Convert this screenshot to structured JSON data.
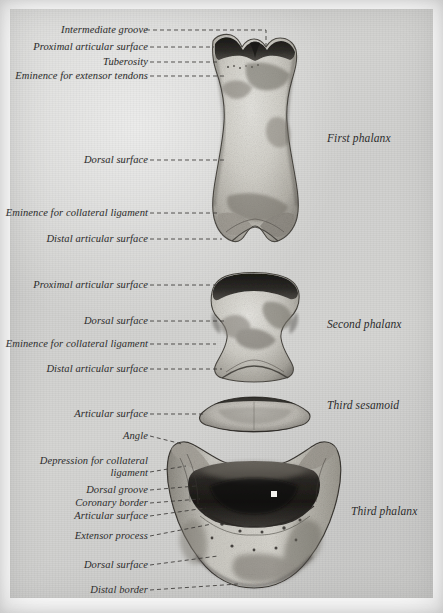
{
  "plate": {
    "subject": "Bones of the equine digit, dorsal aspect",
    "background_color": "#d3d3d1",
    "paper_color": "#d3d3d1",
    "ink_color": "#2b2b2b",
    "bone_light": "#d9d8d3",
    "bone_mid": "#9a9790",
    "bone_dark": "#2e2c29"
  },
  "left_labels": [
    {
      "id": "intermediate-groove",
      "text": "Intermediate groove"
    },
    {
      "id": "proximal-articular-surface-1",
      "text": "Proximal articular surface"
    },
    {
      "id": "tuberosity",
      "text": "Tuberosity"
    },
    {
      "id": "eminence-for-extensor-tendons",
      "text": "Eminence for extensor tendons"
    },
    {
      "id": "dorsal-surface-1",
      "text": "Dorsal surface"
    },
    {
      "id": "eminence-for-collateral-ligament-1",
      "text": "Eminence for collateral ligament"
    },
    {
      "id": "distal-articular-surface-1",
      "text": "Distal articular surface"
    },
    {
      "id": "proximal-articular-surface-2",
      "text": "Proximal articular surface"
    },
    {
      "id": "dorsal-surface-2",
      "text": "Dorsal surface"
    },
    {
      "id": "eminence-for-collateral-ligament-2",
      "text": "Eminence for collateral ligament"
    },
    {
      "id": "distal-articular-surface-2",
      "text": "Distal articular surface"
    },
    {
      "id": "articular-surface-sesamoid",
      "text": "Articular surface"
    },
    {
      "id": "angle",
      "text": "Angle"
    },
    {
      "id": "depression-for-collateral-ligament",
      "text": "Depression for collateral ligament"
    },
    {
      "id": "dorsal-groove",
      "text": "Dorsal groove"
    },
    {
      "id": "coronary-border",
      "text": "Coronary border"
    },
    {
      "id": "articular-surface-third-phalanx",
      "text": "Articular surface"
    },
    {
      "id": "extensor-process",
      "text": "Extensor process"
    },
    {
      "id": "dorsal-surface-3",
      "text": "Dorsal surface"
    },
    {
      "id": "distal-border",
      "text": "Distal border"
    }
  ],
  "right_labels": [
    {
      "id": "first-phalanx",
      "text": "First phalanx"
    },
    {
      "id": "second-phalanx",
      "text": "Second phalanx"
    },
    {
      "id": "third-sesamoid",
      "text": "Third sesamoid"
    },
    {
      "id": "third-phalanx",
      "text": "Third phalanx"
    }
  ],
  "specimens": [
    {
      "id": "first-phalanx-bone",
      "name": "First phalanx"
    },
    {
      "id": "second-phalanx-bone",
      "name": "Second phalanx"
    },
    {
      "id": "third-sesamoid-bone",
      "name": "Third sesamoid"
    },
    {
      "id": "third-phalanx-bone",
      "name": "Third phalanx"
    }
  ]
}
